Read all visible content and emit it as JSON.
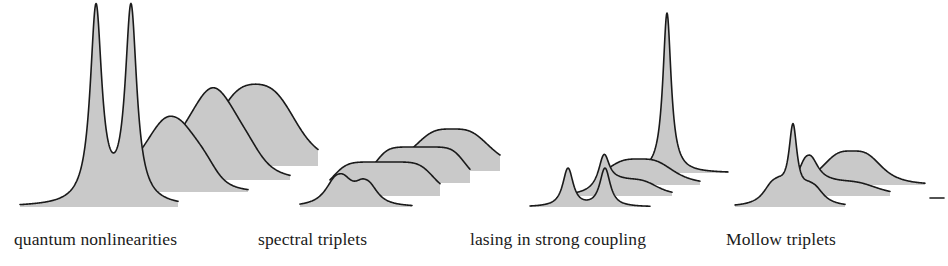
{
  "figure": {
    "background_color": "#ffffff",
    "width": 948,
    "height": 266,
    "stroke_color": "#1a1a1a",
    "fill_color": "#c9c9c9"
  },
  "captions": [
    {
      "id": "quantum-nonlinearities",
      "label": "quantum nonlinearities"
    },
    {
      "id": "spectral-triplets",
      "label": "spectral triplets"
    },
    {
      "id": "lasing-in-strong-coupling",
      "label": "lasing in strong coupling"
    },
    {
      "id": "mollow-triplets",
      "label": "Mollow triplets"
    }
  ],
  "chart_data": {
    "type": "line",
    "subtitle": "",
    "xlabel": "",
    "ylabel": "",
    "grid": false,
    "legend_position": "none",
    "axis_visible": false,
    "tick_labels": [],
    "annotations": [
      "quantum nonlinearities",
      "spectral triplets",
      "lasing in strong coupling",
      "Mollow triplets"
    ],
    "panels": [
      {
        "name": "quantum nonlinearities",
        "caption": "quantum nonlinearities",
        "traces": [
          {
            "index": 0,
            "baseline_y": 207,
            "x_start": 20,
            "x_end": 178,
            "peaks": [
              {
                "center": 96,
                "height": 196,
                "width": 7,
                "shape": "lorentzian-narrow"
              },
              {
                "center": 131,
                "height": 196,
                "width": 7,
                "shape": "lorentzian-narrow"
              }
            ]
          },
          {
            "index": 1,
            "baseline_y": 192,
            "x_start": 112,
            "x_end": 248,
            "peaks": [
              {
                "center": 151,
                "height": 28,
                "width": 10,
                "shape": "broad"
              },
              {
                "center": 166,
                "height": 22,
                "width": 9,
                "shape": "broad"
              },
              {
                "center": 182,
                "height": 26,
                "width": 10,
                "shape": "broad"
              },
              {
                "center": 196,
                "height": 20,
                "width": 9,
                "shape": "broad"
              }
            ]
          },
          {
            "index": 2,
            "baseline_y": 180,
            "x_start": 160,
            "x_end": 290,
            "peaks": [
              {
                "center": 196,
                "height": 36,
                "width": 12,
                "shape": "broad"
              },
              {
                "center": 214,
                "height": 30,
                "width": 11,
                "shape": "broad"
              },
              {
                "center": 231,
                "height": 34,
                "width": 12,
                "shape": "broad"
              }
            ]
          },
          {
            "index": 3,
            "baseline_y": 166,
            "x_start": 205,
            "x_end": 318,
            "peaks": [
              {
                "center": 248,
                "height": 40,
                "width": 16,
                "shape": "broad"
              },
              {
                "center": 263,
                "height": 42,
                "width": 16,
                "shape": "broad"
              }
            ]
          }
        ]
      },
      {
        "name": "spectral triplets",
        "caption": "spectral triplets",
        "traces": [
          {
            "index": 0,
            "baseline_y": 207,
            "x_start": 300,
            "x_end": 412,
            "peaks": [
              {
                "center": 339,
                "height": 30,
                "width": 8,
                "shape": "medium"
              },
              {
                "center": 366,
                "height": 22,
                "width": 7,
                "shape": "medium"
              }
            ]
          },
          {
            "index": 1,
            "baseline_y": 196,
            "x_start": 330,
            "x_end": 440,
            "peaks": [
              {
                "center": 383,
                "height": 34,
                "width": 18,
                "shape": "plateau"
              }
            ]
          },
          {
            "index": 2,
            "baseline_y": 183,
            "x_start": 368,
            "x_end": 470,
            "peaks": [
              {
                "center": 420,
                "height": 36,
                "width": 16,
                "shape": "plateau"
              }
            ]
          },
          {
            "index": 3,
            "baseline_y": 171,
            "x_start": 400,
            "x_end": 500,
            "peaks": [
              {
                "center": 452,
                "height": 42,
                "width": 16,
                "shape": "rounded"
              }
            ]
          }
        ]
      },
      {
        "name": "lasing in strong coupling",
        "caption": "lasing in strong coupling",
        "traces": [
          {
            "index": 0,
            "baseline_y": 207,
            "x_start": 530,
            "x_end": 650,
            "peaks": [
              {
                "center": 568,
                "height": 38,
                "width": 5,
                "shape": "lorentzian"
              },
              {
                "center": 605,
                "height": 38,
                "width": 5,
                "shape": "lorentzian"
              }
            ]
          },
          {
            "index": 1,
            "baseline_y": 196,
            "x_start": 565,
            "x_end": 672,
            "peaks": [
              {
                "center": 604,
                "height": 30,
                "width": 5,
                "shape": "lorentzian"
              },
              {
                "center": 628,
                "height": 16,
                "width": 12,
                "shape": "broad"
              }
            ]
          },
          {
            "index": 2,
            "baseline_y": 185,
            "x_start": 600,
            "x_end": 700,
            "peaks": [
              {
                "center": 639,
                "height": 26,
                "width": 14,
                "shape": "rounded"
              }
            ]
          },
          {
            "index": 3,
            "baseline_y": 173,
            "x_start": 625,
            "x_end": 728,
            "peaks": [
              {
                "center": 667,
                "height": 160,
                "width": 5,
                "shape": "lorentzian-narrow"
              }
            ]
          }
        ]
      },
      {
        "name": "Mollow triplets",
        "caption": "Mollow triplets",
        "traces": [
          {
            "index": 0,
            "baseline_y": 207,
            "x_start": 735,
            "x_end": 845,
            "peaks": [
              {
                "center": 775,
                "height": 22,
                "width": 7,
                "shape": "medium"
              },
              {
                "center": 793,
                "height": 72,
                "width": 5,
                "shape": "lorentzian-narrow"
              },
              {
                "center": 812,
                "height": 18,
                "width": 7,
                "shape": "medium"
              }
            ]
          },
          {
            "index": 1,
            "baseline_y": 196,
            "x_start": 770,
            "x_end": 890,
            "peaks": [
              {
                "center": 808,
                "height": 30,
                "width": 6,
                "shape": "medium"
              },
              {
                "center": 838,
                "height": 14,
                "width": 16,
                "shape": "broad"
              }
            ]
          },
          {
            "index": 2,
            "baseline_y": 185,
            "x_start": 800,
            "x_end": 925,
            "peaks": [
              {
                "center": 852,
                "height": 34,
                "width": 12,
                "shape": "rounded"
              }
            ]
          },
          {
            "index": 3,
            "baseline_y": 198,
            "x_start": 930,
            "x_end": 944,
            "peaks": []
          }
        ]
      }
    ]
  }
}
